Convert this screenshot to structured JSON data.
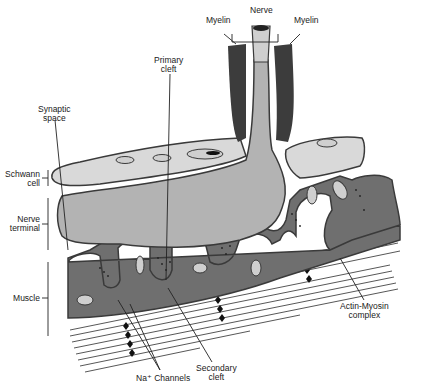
{
  "diagram": {
    "labels": {
      "myelin_left": "Myelin",
      "nerve": "Nerve",
      "myelin_right": "Myelin",
      "primary_cleft_1": "Primary",
      "primary_cleft_2": "cleft",
      "synaptic_space_1": "Synaptic",
      "synaptic_space_2": "space",
      "schwann_cell_1": "Schwann",
      "schwann_cell_2": "cell",
      "nerve_terminal_1": "Nerve",
      "nerve_terminal_2": "terminal",
      "muscle": "Muscle",
      "actin_myosin_1": "Actin-Myosin",
      "actin_myosin_2": "complex",
      "secondary_cleft_1": "Secondary",
      "secondary_cleft_2": "cleft",
      "na_channels": "Na⁺ Channels"
    },
    "colors": {
      "outline": "#3a3a3a",
      "myelin": "#3c3c3c",
      "schwann": "#d9d9d9",
      "nerve_terminal": "#b3b3b3",
      "muscle": "#6f6f6f",
      "background": "#ffffff"
    }
  }
}
